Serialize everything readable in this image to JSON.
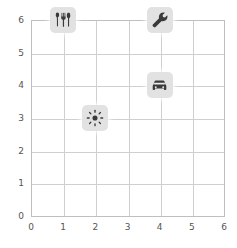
{
  "chart_data": {
    "type": "scatter",
    "title": "",
    "xlabel": "",
    "ylabel": "",
    "xlim": [
      0,
      6
    ],
    "ylim": [
      0,
      6
    ],
    "grid": true,
    "legend": "none",
    "x_ticks": [
      "0",
      "1",
      "2",
      "3",
      "4",
      "5",
      "6"
    ],
    "y_ticks": [
      "0",
      "1",
      "2",
      "3",
      "4",
      "5",
      "6"
    ],
    "points": [
      {
        "label": "restaurant",
        "icon": "utensils-icon",
        "x": 1,
        "y": 6
      },
      {
        "label": "repair",
        "icon": "wrench-icon",
        "x": 4,
        "y": 6
      },
      {
        "label": "car",
        "icon": "car-icon",
        "x": 4,
        "y": 4
      },
      {
        "label": "sun",
        "icon": "sun-icon",
        "x": 2,
        "y": 3
      }
    ]
  },
  "colors": {
    "background": "#ffffff",
    "grid": "#cfcfcf",
    "axis": "#bfbfbf",
    "tick_text": "#555555",
    "marker_badge": "#e2e2e2",
    "icon": "#3a3a3a"
  }
}
